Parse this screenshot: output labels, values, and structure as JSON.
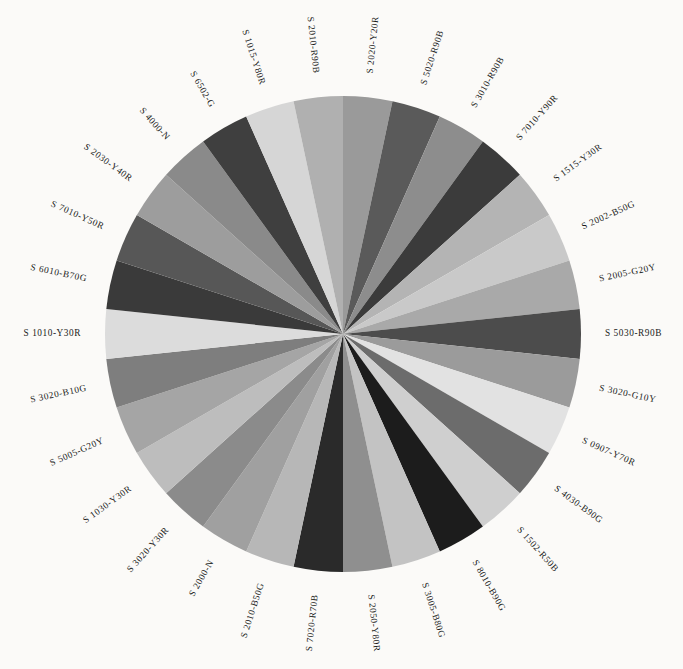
{
  "figure": {
    "background_color": "#fbfaf8",
    "center_x": 343,
    "center_y": 334,
    "radius": 238,
    "label_radius": 262,
    "start_angle_deg": -90,
    "slice_count": 30
  },
  "chart_data": {
    "type": "pie",
    "title": "",
    "subtitle": "",
    "xlabel": "",
    "ylabel": "",
    "legend_position": "none",
    "grid": false,
    "labels_placement": "around-perimeter-rotated",
    "equal_slices": true,
    "slice_angle_deg": 12,
    "categories": [
      "S 2020-Y20R",
      "S 5020-R90B",
      "S 3010-R90B",
      "S 7010-Y90R",
      "S 1515-Y30R",
      "S 2002-B50G",
      "S 2005-G20Y",
      "S 5030-R90B",
      "S 3020-G10Y",
      "S 0907-Y70R",
      "S 4030-B90G",
      "S 1502-R50B",
      "S 8010-B90G",
      "S 3005-B80G",
      "S 2050-Y80R",
      "S 7020-R70B",
      "S 2010-B50G",
      "S 2000-N",
      "S 3020-Y30R",
      "S 1030-Y30R",
      "S 5005-G20Y",
      "S 3020-B10G",
      "S 1010-Y30R",
      "S 6010-B70G",
      "S 7010-Y50R",
      "S 2030-Y40R",
      "S 4000-N",
      "S 6502-G",
      "S 1015-Y80R",
      "S 2010-R90B"
    ],
    "values": [
      1,
      1,
      1,
      1,
      1,
      1,
      1,
      1,
      1,
      1,
      1,
      1,
      1,
      1,
      1,
      1,
      1,
      1,
      1,
      1,
      1,
      1,
      1,
      1,
      1,
      1,
      1,
      1,
      1,
      1
    ],
    "colors": [
      "#9a9a9a",
      "#5a5a5a",
      "#8d8d8d",
      "#3b3b3b",
      "#b4b4b4",
      "#c9c9c9",
      "#a9a9a9",
      "#4c4c4c",
      "#9b9b9b",
      "#e2e2e2",
      "#6c6c6c",
      "#cfcfcf",
      "#1c1c1c",
      "#c3c3c3",
      "#8f8f8f",
      "#2a2a2a",
      "#b7b7b7",
      "#a0a0a0",
      "#8b8b8b",
      "#bdbdbd",
      "#a5a5a5",
      "#7e7e7e",
      "#dcdcdc",
      "#3a3a3a",
      "#575757",
      "#9d9d9d",
      "#8a8a8a",
      "#3f3f3f",
      "#d6d6d6",
      "#b0b0b0"
    ]
  }
}
